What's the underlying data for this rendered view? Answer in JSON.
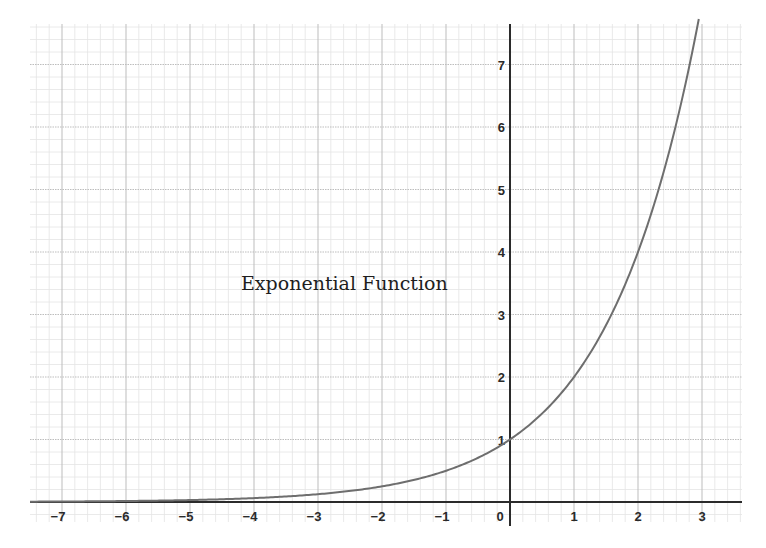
{
  "chart_data": {
    "type": "line",
    "title": "Exponential Function",
    "function": "y = 2^x",
    "xlabel": "",
    "ylabel": "",
    "xlim": [
      -7.5,
      3.65
    ],
    "ylim": [
      -0.3,
      7.65
    ],
    "x_ticks": [
      -7,
      -6,
      -5,
      -4,
      -3,
      -2,
      -1,
      0,
      1,
      2,
      3
    ],
    "x_tick_labels": [
      "−7",
      "−6",
      "−5",
      "−4",
      "−3",
      "−2",
      "−1",
      "0",
      "1",
      "2",
      "3"
    ],
    "y_ticks": [
      1,
      2,
      3,
      4,
      5,
      6,
      7
    ],
    "y_tick_labels": [
      "1",
      "2",
      "3",
      "4",
      "5",
      "6",
      "7"
    ],
    "grid": true,
    "minor_grid_subdivisions": 5,
    "legend": null,
    "series": [
      {
        "name": "2^x",
        "color": "#6e6e6e",
        "x": [
          -7,
          -6,
          -5,
          -4,
          -3,
          -2,
          -1,
          0,
          1,
          2,
          2.5,
          2.95
        ],
        "y": [
          0.0078,
          0.0156,
          0.0313,
          0.0625,
          0.125,
          0.25,
          0.5,
          1,
          2,
          4,
          5.66,
          7.73
        ]
      }
    ]
  },
  "colors": {
    "axis": "#2b2b2b",
    "major_grid": "#bdbdbd",
    "minor_grid": "#e4e4e4",
    "curve": "#6e6e6e",
    "background": "#ffffff"
  },
  "labels": {
    "origin": "0"
  }
}
